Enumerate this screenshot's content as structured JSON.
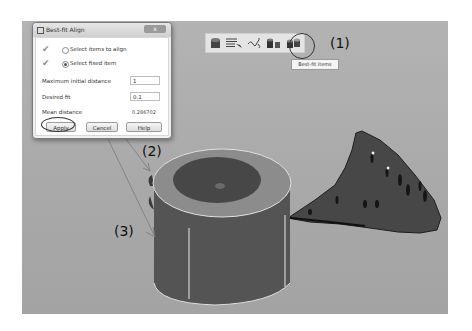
{
  "dialog": {
    "title": "Best-fit Align",
    "close_label": "x",
    "options": [
      {
        "label": "Select items to align",
        "selected": false,
        "checked": true
      },
      {
        "label": "Select fixed item",
        "selected": true,
        "checked": true
      }
    ],
    "fields": {
      "max_initial_distance": {
        "label": "Maximum initial distance",
        "value": "1"
      },
      "desired_fit": {
        "label": "Desired fit",
        "value": "0.1"
      },
      "mean_distance": {
        "label": "Mean distance",
        "value": "0.286702"
      }
    },
    "buttons": {
      "apply": "Apply",
      "cancel": "Cancel",
      "help": "Help"
    }
  },
  "toolbar": {
    "icons": [
      "cylinder-object-icon",
      "list-edit-icon",
      "curve-link-icon",
      "align-objects-icon",
      "best-fit-items-icon"
    ],
    "tooltip": "Best-fit items"
  },
  "callouts": {
    "one": "(1)",
    "two": "(2)",
    "three": "(3)"
  },
  "colors": {
    "viewport_bg": "#ababab",
    "cylinder_body": "#555555",
    "cylinder_top": "#8a8a8a",
    "point_cloud": "#3f3f3f",
    "edge_highlight": "#e8e8e8"
  }
}
